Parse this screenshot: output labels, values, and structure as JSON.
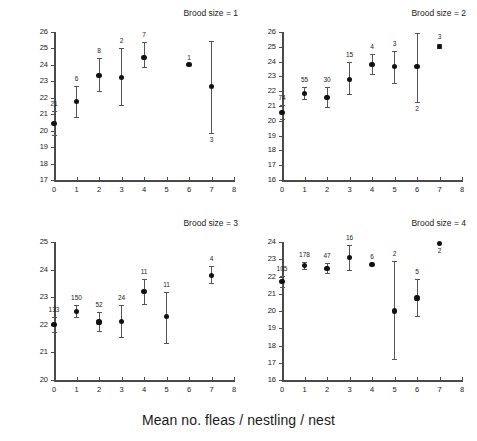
{
  "figure": {
    "xlabel": "Mean no. fleas / nestling / nest",
    "ylabel": "Body mass (g) / nestling / nest"
  },
  "chart_data": {
    "type": "scatter",
    "title": "",
    "xlabel": "Mean no. fleas / nestling / nest",
    "ylabel": "Body mass (g) / nestling / nest",
    "grid": false,
    "legend": "none",
    "error_bars": "95% CI / SE whiskers",
    "point_labels": "sample size (n) printed next to each point",
    "xlim": [
      0,
      8
    ],
    "xticks": [
      0,
      1,
      2,
      3,
      4,
      5,
      6,
      7,
      8
    ],
    "panels": [
      {
        "title": "Brood size = 1",
        "ylim": [
          17,
          26
        ],
        "yticks": [
          17,
          18,
          19,
          20,
          21,
          22,
          23,
          24,
          25,
          26
        ],
        "x": [
          0,
          1,
          2,
          3,
          4,
          6,
          7
        ],
        "y": [
          20.45,
          21.75,
          23.35,
          23.25,
          24.45,
          24.0,
          22.7
        ],
        "ylo": [
          19.75,
          20.85,
          22.4,
          21.55,
          23.85,
          24.0,
          19.85
        ],
        "yhi": [
          21.2,
          22.7,
          24.4,
          25.0,
          25.4,
          24.0,
          25.45
        ],
        "n": [
          "21",
          "6",
          "8",
          "2",
          "7",
          "1",
          "3"
        ],
        "n_pos": [
          "above",
          "above",
          "above",
          "above",
          "above",
          "above",
          "below"
        ]
      },
      {
        "title": "Brood size = 2",
        "ylim": [
          16,
          26
        ],
        "yticks": [
          16,
          17,
          18,
          19,
          20,
          21,
          22,
          23,
          24,
          25,
          26
        ],
        "x": [
          0,
          1,
          2,
          3,
          4,
          5,
          6,
          7
        ],
        "y": [
          20.55,
          21.85,
          21.55,
          22.8,
          23.8,
          23.65,
          23.65,
          25.0
        ],
        "ylo": [
          20.1,
          21.45,
          20.9,
          21.8,
          23.15,
          22.55,
          21.3,
          24.9
        ],
        "yhi": [
          21.05,
          22.3,
          22.3,
          23.95,
          24.5,
          24.75,
          25.95,
          25.2
        ],
        "n": [
          "74",
          "55",
          "30",
          "15",
          "4",
          "3",
          "2",
          "3"
        ],
        "n_pos": [
          "above",
          "above",
          "above",
          "above",
          "above",
          "above",
          "below",
          "above"
        ]
      },
      {
        "title": "Brood size = 3",
        "ylim": [
          20,
          25
        ],
        "yticks": [
          20,
          21,
          22,
          23,
          24,
          25
        ],
        "x": [
          0,
          1,
          2,
          3,
          4,
          5,
          7
        ],
        "y": [
          22.0,
          22.47,
          22.1,
          22.13,
          23.2,
          22.3,
          23.8
        ],
        "ylo": [
          21.75,
          22.27,
          21.78,
          21.57,
          22.75,
          21.35,
          23.5
        ],
        "yhi": [
          22.3,
          22.7,
          22.45,
          22.73,
          23.67,
          23.18,
          24.12
        ],
        "n": [
          "133",
          "150",
          "52",
          "24",
          "11",
          "11",
          "4"
        ],
        "n_pos": [
          "above",
          "above",
          "above",
          "above",
          "above",
          "above",
          "above"
        ]
      },
      {
        "title": "Brood size = 4",
        "ylim": [
          16,
          24
        ],
        "yticks": [
          16,
          17,
          18,
          19,
          20,
          21,
          22,
          23,
          24
        ],
        "x": [
          0,
          1,
          2,
          3,
          4,
          5,
          6,
          7
        ],
        "y": [
          21.7,
          22.63,
          22.48,
          23.1,
          22.7,
          20.0,
          20.75,
          23.9
        ],
        "ylo": [
          21.4,
          22.45,
          22.18,
          22.38,
          22.7,
          17.2,
          19.7,
          23.9
        ],
        "yhi": [
          22.05,
          22.83,
          22.78,
          23.82,
          22.7,
          22.9,
          21.85,
          23.95
        ],
        "n": [
          "105",
          "178",
          "47",
          "16",
          "6",
          "2",
          "5",
          "2"
        ],
        "n_pos": [
          "above",
          "above",
          "above",
          "above",
          "above",
          "above",
          "above",
          "below"
        ]
      }
    ]
  }
}
